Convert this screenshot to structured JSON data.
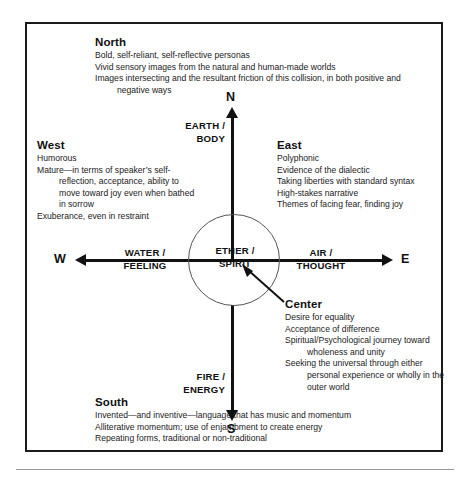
{
  "diagram": {
    "axes": {
      "north_letter": "N",
      "south_letter": "S",
      "west_letter": "W",
      "east_letter": "E",
      "north_element": "EARTH /\nBODY",
      "south_element": "FIRE /\nENERGY",
      "west_element": "WATER /\nFEELING",
      "east_element": "AIR /\nTHOUGHT",
      "center_element": "ETHER /\nSPIRIT"
    },
    "sections": {
      "north": {
        "heading": "North",
        "lines": [
          "Bold, self-reliant, self-reflective personas",
          "Vivid sensory images from the natural and human-made worlds",
          "Images intersecting and the resultant friction of this collision, in both positive and negative ways"
        ]
      },
      "west": {
        "heading": "West",
        "lines": [
          "Humorous",
          "Mature—in terms of speaker’s self-reflection, acceptance, ability to move toward joy even when bathed in sorrow",
          "Exuberance, even in restraint"
        ]
      },
      "east": {
        "heading": "East",
        "lines": [
          "Polyphonic",
          "Evidence of the dialectic",
          "Taking liberties with standard syntax",
          "High-stakes narrative",
          "Themes of facing fear, finding joy"
        ]
      },
      "center": {
        "heading": "Center",
        "lines": [
          "Desire for equality",
          "Acceptance of difference",
          "Spiritual/Psychological journey toward wholeness and unity",
          "Seeking the universal through either personal experience or wholly in the outer world"
        ]
      },
      "south": {
        "heading": "South",
        "lines": [
          "Invented—and inventive—language that has music and momentum",
          "Alliterative momentum; use of enjambment to create energy",
          "Repeating forms, traditional or non-traditional"
        ]
      }
    },
    "colors": {
      "frame": "#1a1a1a",
      "axis": "#111111",
      "circle": "#555555",
      "text": "#1a1a1a",
      "rule": "#9a9a9a"
    }
  }
}
